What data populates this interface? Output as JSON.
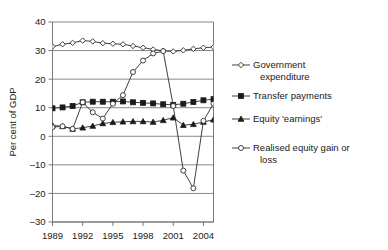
{
  "chart_data": {
    "type": "line",
    "title": "",
    "xlabel": "",
    "ylabel": "Per cent of GDP",
    "ylim": [
      -30,
      40
    ],
    "ytick_labels": [
      "40",
      "30",
      "20",
      "10",
      "0",
      "-10",
      "-20",
      "-30"
    ],
    "ytick_values": [
      40,
      30,
      20,
      10,
      0,
      -10,
      -20,
      -30
    ],
    "xtick_labels": [
      "1989",
      "1992",
      "1995",
      "1998",
      "2001",
      "2004"
    ],
    "xtick_values": [
      1989,
      1992,
      1995,
      1998,
      2001,
      2004
    ],
    "xlim": [
      1989,
      2005
    ],
    "grid": true,
    "legend_position": "right",
    "x": [
      1989,
      1990,
      1991,
      1992,
      1993,
      1994,
      1995,
      1996,
      1997,
      1998,
      1999,
      2000,
      2001,
      2002,
      2003,
      2004,
      2005
    ],
    "series": [
      {
        "name": "Government expenditure",
        "marker": "open-diamond",
        "values": [
          31.4,
          32.2,
          32.7,
          33.5,
          33.2,
          32.6,
          32.4,
          32.2,
          31.6,
          31.0,
          30.4,
          29.9,
          29.7,
          30.1,
          30.6,
          31.0,
          31.2
        ]
      },
      {
        "name": "Transfer  payments",
        "marker": "filled-square",
        "values": [
          9.8,
          10.1,
          10.6,
          11.9,
          12.1,
          12.1,
          12.1,
          12.2,
          11.9,
          11.7,
          11.5,
          11.2,
          11.0,
          11.4,
          12.0,
          12.6,
          13.0
        ]
      },
      {
        "name": "Equity 'earnings'",
        "marker": "filled-triangle",
        "values": [
          3.8,
          3.5,
          2.6,
          3.0,
          3.6,
          4.5,
          4.9,
          5.1,
          5.2,
          5.2,
          5.0,
          5.6,
          6.5,
          3.9,
          4.2,
          5.0,
          5.8
        ]
      },
      {
        "name": "Realised equity gain or loss",
        "marker": "open-circle",
        "values": [
          3.2,
          3.5,
          2.6,
          11.9,
          8.4,
          6.2,
          11.4,
          14.4,
          22.5,
          26.5,
          29.0,
          29.8,
          10.6,
          -12.0,
          -18.2,
          5.4,
          11.4
        ]
      }
    ]
  },
  "legend": {
    "items": [
      {
        "label_line1": "Government",
        "label_line2": "expenditure",
        "marker": "open-diamond"
      },
      {
        "label_line1": "Transfer  payments",
        "label_line2": "",
        "marker": "filled-square"
      },
      {
        "label_line1": "Equity 'earnings'",
        "label_line2": "",
        "marker": "filled-triangle"
      },
      {
        "label_line1": "Realised equity gain or",
        "label_line2": "loss",
        "marker": "open-circle"
      }
    ]
  }
}
